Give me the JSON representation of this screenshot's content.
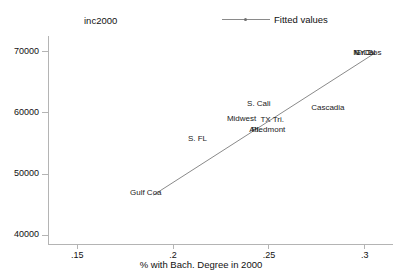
{
  "header": {
    "clipped_top_text": "",
    "y_variable_label": "inc2000"
  },
  "legend": {
    "position": "top-center-right",
    "entries": [
      {
        "label": "Fitted values",
        "marker": "line-with-dot",
        "color": "#8a8a8a"
      }
    ]
  },
  "chart_data": {
    "type": "scatter",
    "title": "",
    "subtitle": "",
    "xlabel": "% with Bach. Degree in 2000",
    "ylabel": "inc2000",
    "xlim": [
      0.135,
      0.315
    ],
    "ylim": [
      38500,
      72500
    ],
    "grid": false,
    "legend_position": "top",
    "xticks": [
      0.15,
      0.2,
      0.25,
      0.3
    ],
    "xtick_labels": [
      ".15",
      ".2",
      ".25",
      ".3"
    ],
    "yticks": [
      40000,
      50000,
      60000,
      70000
    ],
    "ytick_labels": [
      "40000",
      "50000",
      "60000",
      "70000"
    ],
    "marker_style": "text-label",
    "points": [
      {
        "label": "Gulf Coa",
        "x": 0.186,
        "y": 46800
      },
      {
        "label": "S. FL",
        "x": 0.213,
        "y": 55600
      },
      {
        "label": "Atl.",
        "x": 0.243,
        "y": 57100
      },
      {
        "label": "Piedmont",
        "x": 0.25,
        "y": 57100
      },
      {
        "label": "Midwest",
        "x": 0.236,
        "y": 58900
      },
      {
        "label": "TX Tri.",
        "x": 0.252,
        "y": 58800
      },
      {
        "label": "S. Cali",
        "x": 0.245,
        "y": 61400
      },
      {
        "label": "Cascadia",
        "x": 0.281,
        "y": 60700
      },
      {
        "label": "N. Cal",
        "x": 0.3,
        "y": 69700
      },
      {
        "label": "Gr. Bos",
        "x": 0.302,
        "y": 69700
      },
      {
        "label": "NYC",
        "x": 0.299,
        "y": 69700
      }
    ],
    "series": [
      {
        "name": "Fitted values",
        "type": "line",
        "color": "#8a8a8a",
        "x": [
          0.19,
          0.306
        ],
        "values": [
          46500,
          69800
        ]
      }
    ]
  }
}
